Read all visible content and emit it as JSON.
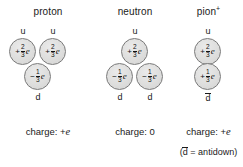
{
  "figure": {
    "background": "#ffffff",
    "circle_fill": "#dededd",
    "circle_stroke": "#7a7a7a"
  },
  "particles": [
    {
      "id": "proton",
      "name": "proton",
      "superscript": "",
      "quarks": [
        {
          "label": "u",
          "sign": "+",
          "numerator": "2",
          "denominator": "3",
          "unit": "e"
        },
        {
          "label": "u",
          "sign": "+",
          "numerator": "2",
          "denominator": "3",
          "unit": "e"
        },
        {
          "label": "d",
          "sign": "−",
          "numerator": "1",
          "denominator": "3",
          "unit": "e"
        }
      ],
      "top_labels": [
        "u",
        "u"
      ],
      "bottom_labels": [
        "d"
      ],
      "charge_text_prefix": "charge: +",
      "charge_text_italic": "e",
      "charge_text_plain": ""
    },
    {
      "id": "neutron",
      "name": "neutron",
      "superscript": "",
      "quarks": [
        {
          "label": "u",
          "sign": "+",
          "numerator": "2",
          "denominator": "3",
          "unit": "e"
        },
        {
          "label": "d",
          "sign": "−",
          "numerator": "1",
          "denominator": "3",
          "unit": "e"
        },
        {
          "label": "d",
          "sign": "−",
          "numerator": "1",
          "denominator": "3",
          "unit": "e"
        }
      ],
      "top_labels": [
        "u"
      ],
      "bottom_labels": [
        "d",
        "d"
      ],
      "charge_text_prefix": "charge: ",
      "charge_text_italic": "",
      "charge_text_plain": "0"
    },
    {
      "id": "pion",
      "name": "pion",
      "superscript": "+",
      "quarks": [
        {
          "label": "u",
          "sign": "+",
          "numerator": "2",
          "denominator": "3",
          "unit": "e"
        },
        {
          "label": "dbar",
          "sign": "+",
          "numerator": "1",
          "denominator": "3",
          "unit": "e"
        }
      ],
      "top_labels": [
        "u"
      ],
      "bottom_labels": [
        "d"
      ],
      "charge_text_prefix": "charge: +",
      "charge_text_italic": "e",
      "charge_text_plain": ""
    }
  ],
  "footnote": {
    "open_paren": "(",
    "symbol": "d",
    "equals": " = antidown)"
  }
}
